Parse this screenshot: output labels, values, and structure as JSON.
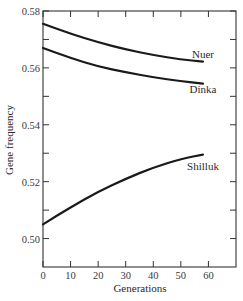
{
  "chart_data": {
    "type": "line",
    "title": "",
    "xlabel": "Generations",
    "ylabel": "Gene frequency",
    "xlim": [
      0,
      70
    ],
    "ylim": [
      0.49,
      0.58
    ],
    "x_ticks": [
      0,
      10,
      20,
      30,
      40,
      50,
      60
    ],
    "x_tick_labels": [
      "0",
      "10",
      "20",
      "30",
      "40",
      "50",
      "60"
    ],
    "y_ticks": [
      0.5,
      0.52,
      0.54,
      0.56,
      0.58
    ],
    "y_tick_labels": [
      "0.50",
      "0.52",
      "0.54",
      "0.56",
      "0.58"
    ],
    "grid": false,
    "legend": "inline labels at line ends",
    "x": [
      0,
      10,
      20,
      30,
      40,
      50,
      58
    ],
    "series": [
      {
        "name": "Nuer",
        "values": [
          0.5755,
          0.572,
          0.569,
          0.5665,
          0.5645,
          0.563,
          0.5622
        ]
      },
      {
        "name": "Dinka",
        "values": [
          0.567,
          0.5635,
          0.5605,
          0.5585,
          0.5567,
          0.5553,
          0.5545
        ]
      },
      {
        "name": "Shilluk",
        "values": [
          0.505,
          0.511,
          0.5165,
          0.521,
          0.525,
          0.528,
          0.5295
        ]
      }
    ],
    "series_color": "#1a1a1a"
  }
}
